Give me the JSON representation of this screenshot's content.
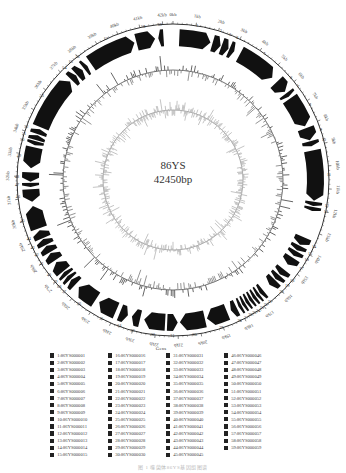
{
  "figure": {
    "genome_name": "86YS",
    "genome_length_label": "42450bp",
    "genome_length_bp": 42450,
    "genes_ring_label": "Gens",
    "caption": "图 1  噬菌体86YS基因组图谱"
  },
  "colors": {
    "gene_fill": "#111111",
    "gc_content": "#555555",
    "gc_skew": "#aaaaaa",
    "ring_line": "#333333",
    "background": "#ffffff"
  },
  "chart_data": {
    "type": "circular_genome_map",
    "total_length_bp": 42450,
    "tick_labels": [
      "0kb",
      "1kb",
      "2kb",
      "3kb",
      "4kb",
      "5kb",
      "6kb",
      "7kb",
      "8kb",
      "9kb",
      "10kb",
      "11kb",
      "12kb",
      "13kb",
      "14kb",
      "15kb",
      "16kb",
      "17kb",
      "18kb",
      "19kb",
      "20kb",
      "21kb",
      "22kb",
      "23kb",
      "24kb",
      "25kb",
      "26kb",
      "27kb",
      "28kb",
      "29kb",
      "30kb",
      "31kb",
      "32kb",
      "33kb",
      "34kb",
      "35kb",
      "36kb",
      "37kb",
      "38kb",
      "39kb",
      "40kb",
      "41kb",
      "42kb"
    ],
    "rings": [
      "ORFs (forward/reverse arrows)",
      "GC content",
      "GC skew"
    ],
    "orfs": [
      {
        "id": 1,
        "start_kb": 0.3,
        "end_kb": 1.8,
        "strand": "+"
      },
      {
        "id": 2,
        "start_kb": 1.9,
        "end_kb": 2.3,
        "strand": "+"
      },
      {
        "id": 3,
        "start_kb": 2.35,
        "end_kb": 2.7,
        "strand": "+"
      },
      {
        "id": 4,
        "start_kb": 2.75,
        "end_kb": 3.0,
        "strand": "+"
      },
      {
        "id": 5,
        "start_kb": 3.3,
        "end_kb": 5.2,
        "strand": "+"
      },
      {
        "id": 6,
        "start_kb": 5.5,
        "end_kb": 6.1,
        "strand": "+"
      },
      {
        "id": 7,
        "start_kb": 6.2,
        "end_kb": 6.4,
        "strand": "+"
      },
      {
        "id": 8,
        "start_kb": 6.5,
        "end_kb": 8.0,
        "strand": "+"
      },
      {
        "id": 9,
        "start_kb": 8.1,
        "end_kb": 8.7,
        "strand": "+"
      },
      {
        "id": 10,
        "start_kb": 8.75,
        "end_kb": 9.0,
        "strand": "+"
      },
      {
        "id": 11,
        "start_kb": 9.2,
        "end_kb": 11.6,
        "strand": "+"
      },
      {
        "id": 12,
        "start_kb": 11.65,
        "end_kb": 11.85,
        "strand": "+"
      },
      {
        "id": 13,
        "start_kb": 11.9,
        "end_kb": 12.1,
        "strand": "+"
      },
      {
        "id": 14,
        "start_kb": 13.4,
        "end_kb": 13.8,
        "strand": "+"
      },
      {
        "id": 15,
        "start_kb": 13.85,
        "end_kb": 14.1,
        "strand": "+"
      },
      {
        "id": 16,
        "start_kb": 14.15,
        "end_kb": 14.4,
        "strand": "+"
      },
      {
        "id": 17,
        "start_kb": 14.5,
        "end_kb": 14.9,
        "strand": "+"
      },
      {
        "id": 18,
        "start_kb": 15.2,
        "end_kb": 15.5,
        "strand": "+"
      },
      {
        "id": 19,
        "start_kb": 15.55,
        "end_kb": 15.8,
        "strand": "+"
      },
      {
        "id": 20,
        "start_kb": 15.85,
        "end_kb": 16.2,
        "strand": "+"
      },
      {
        "id": 21,
        "start_kb": 16.6,
        "end_kb": 16.8,
        "strand": "+"
      },
      {
        "id": 22,
        "start_kb": 16.85,
        "end_kb": 17.0,
        "strand": "+"
      },
      {
        "id": 23,
        "start_kb": 17.05,
        "end_kb": 17.2,
        "strand": "+"
      },
      {
        "id": 24,
        "start_kb": 17.25,
        "end_kb": 17.4,
        "strand": "+"
      },
      {
        "id": 25,
        "start_kb": 17.45,
        "end_kb": 17.6,
        "strand": "+"
      },
      {
        "id": 26,
        "start_kb": 17.65,
        "end_kb": 17.8,
        "strand": "+"
      },
      {
        "id": 27,
        "start_kb": 17.85,
        "end_kb": 18.0,
        "strand": "+"
      },
      {
        "id": 28,
        "start_kb": 18.1,
        "end_kb": 18.4,
        "strand": "+"
      },
      {
        "id": 29,
        "start_kb": 18.6,
        "end_kb": 19.6,
        "strand": "+"
      },
      {
        "id": 30,
        "start_kb": 19.7,
        "end_kb": 20.9,
        "strand": "+"
      },
      {
        "id": 31,
        "start_kb": 21.0,
        "end_kb": 21.5,
        "strand": "-"
      },
      {
        "id": 32,
        "start_kb": 21.6,
        "end_kb": 22.6,
        "strand": "+"
      },
      {
        "id": 33,
        "start_kb": 22.8,
        "end_kb": 23.2,
        "strand": "+"
      },
      {
        "id": 34,
        "start_kb": 23.4,
        "end_kb": 23.8,
        "strand": "-"
      },
      {
        "id": 35,
        "start_kb": 24.0,
        "end_kb": 24.9,
        "strand": "+"
      },
      {
        "id": 36,
        "start_kb": 25.1,
        "end_kb": 26.1,
        "strand": "+"
      },
      {
        "id": 37,
        "start_kb": 26.3,
        "end_kb": 26.6,
        "strand": "+"
      },
      {
        "id": 38,
        "start_kb": 26.65,
        "end_kb": 26.85,
        "strand": "+"
      },
      {
        "id": 39,
        "start_kb": 26.9,
        "end_kb": 27.1,
        "strand": "+"
      },
      {
        "id": 40,
        "start_kb": 27.15,
        "end_kb": 27.7,
        "strand": "+"
      },
      {
        "id": 41,
        "start_kb": 27.8,
        "end_kb": 28.2,
        "strand": "+"
      },
      {
        "id": 42,
        "start_kb": 28.25,
        "end_kb": 28.6,
        "strand": "+"
      },
      {
        "id": 43,
        "start_kb": 28.65,
        "end_kb": 28.95,
        "strand": "+"
      },
      {
        "id": 44,
        "start_kb": 29.0,
        "end_kb": 29.4,
        "strand": "+"
      },
      {
        "id": 45,
        "start_kb": 29.5,
        "end_kb": 30.6,
        "strand": "+"
      },
      {
        "id": 46,
        "start_kb": 30.8,
        "end_kb": 31.4,
        "strand": "-"
      },
      {
        "id": 47,
        "start_kb": 31.5,
        "end_kb": 31.7,
        "strand": "-"
      },
      {
        "id": 48,
        "start_kb": 31.75,
        "end_kb": 32.2,
        "strand": "-"
      },
      {
        "id": 49,
        "start_kb": 32.4,
        "end_kb": 33.4,
        "strand": "-"
      },
      {
        "id": 50,
        "start_kb": 33.5,
        "end_kb": 33.7,
        "strand": "-"
      },
      {
        "id": 51,
        "start_kb": 33.75,
        "end_kb": 34.0,
        "strand": "+"
      },
      {
        "id": 52,
        "start_kb": 34.05,
        "end_kb": 34.3,
        "strand": "+"
      },
      {
        "id": 53,
        "start_kb": 34.4,
        "end_kb": 37.0,
        "strand": "+"
      },
      {
        "id": 54,
        "start_kb": 37.1,
        "end_kb": 37.4,
        "strand": "+"
      },
      {
        "id": 55,
        "start_kb": 37.45,
        "end_kb": 37.8,
        "strand": "+"
      },
      {
        "id": 56,
        "start_kb": 37.9,
        "end_kb": 38.1,
        "strand": "+"
      },
      {
        "id": 57,
        "start_kb": 38.3,
        "end_kb": 40.6,
        "strand": "+"
      },
      {
        "id": 58,
        "start_kb": 40.7,
        "end_kb": 41.6,
        "strand": "+"
      },
      {
        "id": 59,
        "start_kb": 41.75,
        "end_kb": 42.0,
        "strand": "-"
      }
    ]
  },
  "legend": {
    "items": [
      "1:86YS000001",
      "2:86YS000002",
      "3:86YS000003",
      "4:86YS000004",
      "5:86YS000005",
      "6:86YS000006",
      "7:86YS000007",
      "8:86YS000008",
      "9:86YS000009",
      "10:86YS000010",
      "11:86YS000011",
      "12:86YS000012",
      "13:86YS000013",
      "14:86YS000014",
      "15:86YS000015",
      "16:86YS000016",
      "17:86YS000017",
      "18:86YS000018",
      "19:86YS000019",
      "20:86YS000020",
      "21:86YS000021",
      "22:86YS000022",
      "23:86YS000023",
      "24:86YS000024",
      "25:86YS000025",
      "26:86YS000026",
      "27:86YS000027",
      "28:86YS000028",
      "29:86YS000029",
      "30:86YS000030",
      "31:86YS000031",
      "32:86YS000032",
      "33:86YS000033",
      "34:86YS000034",
      "35:86YS000035",
      "36:86YS000036",
      "37:86YS000037",
      "38:86YS000038",
      "39:86YS000039",
      "40:86YS000040",
      "41:86YS000041",
      "42:86YS000042",
      "43:86YS000043",
      "44:86YS000044",
      "45:86YS000045",
      "46:86YS000046",
      "47:86YS000047",
      "48:86YS000048",
      "49:86YS000049",
      "50:86YS000050",
      "51:86YS000051",
      "52:86YS000052",
      "53:86YS000053",
      "54:86YS000054",
      "55:86YS000055",
      "56:86YS000056",
      "57:86YS000057",
      "58:86YS000058",
      "59:86YS000059"
    ]
  }
}
